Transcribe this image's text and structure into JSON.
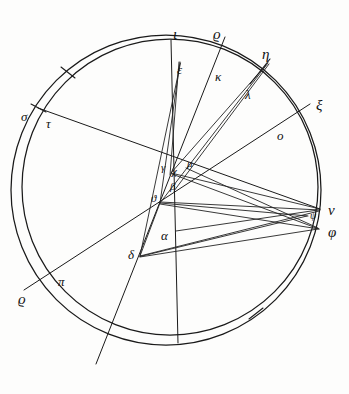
{
  "figure": {
    "ink_color": "#1a1a1a",
    "background_color": "#fdfdfc",
    "width": 349,
    "height": 394
  },
  "labels": {
    "iota": {
      "text": "ι",
      "x": 173,
      "y": 27,
      "size": "g-lg"
    },
    "rho_top": {
      "text": "ϱ",
      "x": 213,
      "y": 27,
      "size": "g-lg"
    },
    "eta": {
      "text": "η",
      "x": 262,
      "y": 47,
      "size": "g-lg"
    },
    "epsilon": {
      "text": "ε",
      "x": 177,
      "y": 63,
      "size": "g-md"
    },
    "kappa": {
      "text": "κ",
      "x": 215,
      "y": 70,
      "size": "g-md"
    },
    "lambda": {
      "text": "λ",
      "x": 245,
      "y": 88,
      "size": "g-md"
    },
    "xi": {
      "text": "ξ",
      "x": 316,
      "y": 98,
      "size": "g-lg"
    },
    "sigma": {
      "text": "σ",
      "x": 21,
      "y": 110,
      "size": "g-md"
    },
    "tau": {
      "text": "τ",
      "x": 46,
      "y": 117,
      "size": "g-md"
    },
    "omicron": {
      "text": "ο",
      "x": 277,
      "y": 129,
      "size": "g-md"
    },
    "gamma": {
      "text": "γ",
      "x": 161,
      "y": 162,
      "size": "g-sm"
    },
    "chi": {
      "text": "χ",
      "x": 172,
      "y": 166,
      "size": "g-sm"
    },
    "mu": {
      "text": "μ",
      "x": 187,
      "y": 158,
      "size": "g-sm"
    },
    "beta": {
      "text": "β",
      "x": 170,
      "y": 181,
      "size": "g-sm"
    },
    "theta": {
      "text": "ϑ",
      "x": 151,
      "y": 193,
      "size": "g-sm"
    },
    "nu": {
      "text": "ν",
      "x": 328,
      "y": 203,
      "size": "g-lg"
    },
    "psi": {
      "text": "ψ",
      "x": 310,
      "y": 211,
      "size": "g-xs"
    },
    "phi": {
      "text": "φ",
      "x": 328,
      "y": 225,
      "size": "g-lg"
    },
    "alpha": {
      "text": "α",
      "x": 161,
      "y": 229,
      "size": "g-md"
    },
    "delta": {
      "text": "δ",
      "x": 128,
      "y": 248,
      "size": "g-md"
    },
    "pi": {
      "text": "π",
      "x": 58,
      "y": 275,
      "size": "g-md"
    },
    "rho_bottom": {
      "text": "ϱ",
      "x": 18,
      "y": 292,
      "size": "g-lg"
    }
  },
  "geometry": {
    "outer_circle": {
      "cx": 166,
      "cy": 190,
      "rx": 155,
      "ry": 155,
      "rotation": 0
    },
    "inner_circle": {
      "cx": 170,
      "cy": 187,
      "rx": 148,
      "ry": 148,
      "rotation": 0
    },
    "points": {
      "iota": {
        "x": 171,
        "y": 40
      },
      "epsilon": {
        "x": 180,
        "y": 62
      },
      "kappa": {
        "x": 220,
        "y": 62
      },
      "rho_top": {
        "x": 224,
        "y": 41
      },
      "eta": {
        "x": 268,
        "y": 62
      },
      "lambda": {
        "x": 252,
        "y": 81
      },
      "xi": {
        "x": 307,
        "y": 107
      },
      "omicron": {
        "x": 288,
        "y": 121
      },
      "sigma": {
        "x": 36,
        "y": 107
      },
      "tau": {
        "x": 44,
        "y": 120
      },
      "nu": {
        "x": 318,
        "y": 208
      },
      "psi": {
        "x": 305,
        "y": 215
      },
      "phi": {
        "x": 319,
        "y": 228
      },
      "gamma": {
        "x": 172,
        "y": 172
      },
      "chi": {
        "x": 176,
        "y": 172
      },
      "mu": {
        "x": 186,
        "y": 168
      },
      "beta": {
        "x": 174,
        "y": 190
      },
      "theta": {
        "x": 160,
        "y": 202
      },
      "alpha": {
        "x": 174,
        "y": 230
      },
      "delta": {
        "x": 140,
        "y": 255
      },
      "pi": {
        "x": 68,
        "y": 268
      },
      "rho_bot": {
        "x": 40,
        "y": 285
      }
    },
    "lines": [
      {
        "name": "iota-vertical-axis",
        "x1": 171,
        "y1": 40,
        "x2": 178,
        "y2": 343
      },
      {
        "name": "rho-kappa-extended",
        "x1": 225,
        "y1": 37,
        "x2": 96,
        "y2": 364
      },
      {
        "name": "sigma-tau-to-nu",
        "x1": 38,
        "y1": 108,
        "x2": 320,
        "y2": 209
      },
      {
        "name": "xi-to-rho-bottom",
        "x1": 310,
        "y1": 104,
        "x2": 24,
        "y2": 290
      },
      {
        "name": "epsilon-to-theta",
        "x1": 180,
        "y1": 62,
        "x2": 160,
        "y2": 203
      },
      {
        "name": "epsilon-to-delta",
        "x1": 180,
        "y1": 63,
        "x2": 140,
        "y2": 256
      },
      {
        "name": "eta-to-theta",
        "x1": 268,
        "y1": 63,
        "x2": 160,
        "y2": 203
      },
      {
        "name": "eta-to-gamma",
        "x1": 267,
        "y1": 64,
        "x2": 171,
        "y2": 173
      },
      {
        "name": "eta-to-beta",
        "x1": 268,
        "y1": 64,
        "x2": 174,
        "y2": 191
      },
      {
        "name": "gamma-to-nu",
        "x1": 171,
        "y1": 173,
        "x2": 320,
        "y2": 209
      },
      {
        "name": "gamma-to-phi",
        "x1": 172,
        "y1": 173,
        "x2": 319,
        "y2": 229
      },
      {
        "name": "theta-to-nu",
        "x1": 160,
        "y1": 203,
        "x2": 320,
        "y2": 210
      },
      {
        "name": "theta-to-psi",
        "x1": 160,
        "y1": 203,
        "x2": 308,
        "y2": 216
      },
      {
        "name": "theta-to-phi",
        "x1": 160,
        "y1": 203,
        "x2": 319,
        "y2": 229
      },
      {
        "name": "delta-to-nu",
        "x1": 140,
        "y1": 256,
        "x2": 319,
        "y2": 211
      },
      {
        "name": "delta-to-psi",
        "x1": 140,
        "y1": 256,
        "x2": 307,
        "y2": 216
      },
      {
        "name": "delta-to-phi",
        "x1": 140,
        "y1": 256,
        "x2": 318,
        "y2": 229
      },
      {
        "name": "delta-to-theta",
        "x1": 140,
        "y1": 256,
        "x2": 160,
        "y2": 203
      },
      {
        "name": "mu-to-phi",
        "x1": 186,
        "y1": 168,
        "x2": 318,
        "y2": 228
      },
      {
        "name": "alpha-to-nu",
        "x1": 176,
        "y1": 231,
        "x2": 318,
        "y2": 210
      }
    ],
    "radial_ticks": [
      {
        "name": "tick-sigma-tau",
        "x1": 31,
        "y1": 104,
        "x2": 46,
        "y2": 112
      },
      {
        "name": "tick-eta-lambda",
        "x1": 270,
        "y1": 59,
        "x2": 250,
        "y2": 84
      },
      {
        "name": "tick-arc-upper-left",
        "x1": 62,
        "y1": 68,
        "x2": 74,
        "y2": 77
      },
      {
        "name": "tick-arc-lower-right",
        "x1": 250,
        "y1": 318,
        "x2": 262,
        "y2": 309
      }
    ]
  }
}
